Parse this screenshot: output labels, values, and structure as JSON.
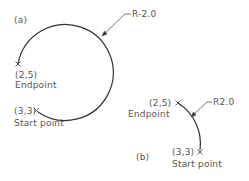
{
  "diagram": {
    "type": "arc-direction-illustration",
    "stroke_color": "#333333",
    "text_color": "#555555",
    "panel_a": {
      "label": "(a)",
      "radius_label": "R-2.0",
      "endpoint": {
        "coord": "(2,5)",
        "name": "Endpoint"
      },
      "startpoint": {
        "coord": "(3,3)",
        "name": "Start point"
      },
      "description": "Large (major) arc drawn clockwise from start point (3,3) to endpoint (2,5) with negative radius"
    },
    "panel_b": {
      "label": "(b)",
      "radius_label": "R2.0",
      "endpoint": {
        "coord": "(2,5)",
        "name": "Endpoint"
      },
      "startpoint": {
        "coord": "(3,3)",
        "name": "Start point"
      },
      "description": "Small (minor) arc drawn from start point (3,3) to endpoint (2,5) with positive radius"
    }
  }
}
